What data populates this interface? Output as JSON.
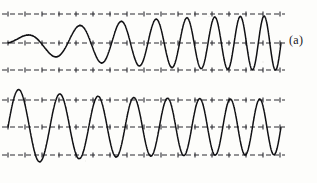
{
  "figure": {
    "background_color": "#fdfdfb",
    "ink_color": "#111114",
    "guide_color": "#2a2a30",
    "width": 317,
    "height": 183
  },
  "panels": [
    {
      "id": "a",
      "label": "(a)",
      "description": "oscillation amplitude builds up gradually from near zero to steady-state envelope",
      "envelope_behavior": "soft-start-growth",
      "start_amplitude_fraction": 0.1,
      "final_amplitude_fraction": 1.0,
      "overshoot": false,
      "cycles": 8,
      "guide_lines": {
        "top_y": 14,
        "center_y": 43,
        "bottom_y": 70
      },
      "wave_x_start": 8,
      "wave_x_end": 281
    },
    {
      "id": "b",
      "label": "(b)",
      "description": "oscillation starts at large amplitude, overshoots the envelope, then decays down to the same steady-state level",
      "envelope_behavior": "overshoot-decay",
      "start_amplitude_fraction": 1.42,
      "final_amplitude_fraction": 1.0,
      "overshoot": true,
      "cycles": 8,
      "guide_lines": {
        "top_y": 12,
        "center_y": 39,
        "bottom_y": 67
      },
      "wave_x_start": 8,
      "wave_x_end": 281
    }
  ],
  "chart_data": {
    "type": "line",
    "title": "",
    "xlabel": "",
    "ylabel": "",
    "grid": false,
    "legend": "none",
    "annotations": [
      "(a)",
      "(b)"
    ],
    "series": [
      {
        "name": "(a) amplitude build-up",
        "envelope": "A_final * (1 - exp(-t/tau))",
        "start_amplitude": 0.1,
        "steady_amplitude": 1.0,
        "peak_amplitude": 1.0,
        "overshoot": 0.0,
        "cycles": 8
      },
      {
        "name": "(b) overshoot and settle",
        "envelope": "A_final * (1 + k*exp(-t/tau))",
        "start_amplitude": 1.42,
        "steady_amplitude": 1.0,
        "peak_amplitude": 1.42,
        "overshoot": 0.42,
        "cycles": 8
      }
    ],
    "xlim": [
      0,
      8
    ],
    "ylim": [
      -1.5,
      1.5
    ]
  }
}
